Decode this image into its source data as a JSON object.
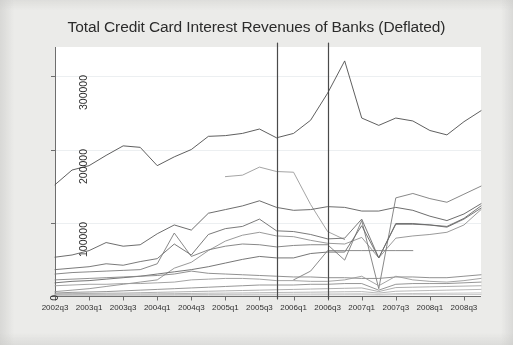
{
  "figure": {
    "background_color": "#ebebe9",
    "plot_background_color": "#ffffff",
    "frame_color": "#6e6e6e"
  },
  "chart_data": {
    "type": "line",
    "title": "Total Credit Card Interest Revenues of Banks (Deflated)",
    "xlabel": "",
    "ylabel": "",
    "grid": true,
    "legend_position": "none",
    "ylim": [
      0,
      340000
    ],
    "yticks": [
      0,
      100000,
      200000,
      300000
    ],
    "ytick_labels": [
      "0",
      "100000",
      "200000",
      "300000"
    ],
    "x": [
      "2002q3",
      "2002q4",
      "2003q1",
      "2003q2",
      "2003q3",
      "2003q4",
      "2004q1",
      "2004q2",
      "2004q3",
      "2004q4",
      "2005q1",
      "2005q2",
      "2005q3",
      "2005q4",
      "2006q1",
      "2006q2",
      "2006q3",
      "2006q4",
      "2007q1",
      "2007q2",
      "2007q3",
      "2007q4",
      "2008q1",
      "2008q2",
      "2008q3",
      "2008q4"
    ],
    "xtick_labels": [
      "2002q3",
      "2003q1",
      "2003q3",
      "2004q1",
      "2004q3",
      "2005q1",
      "2005q3",
      "2006q1",
      "2006q3",
      "2007q1",
      "2007q3",
      "2008q1",
      "2008q3"
    ],
    "xtick_indices": [
      0,
      2,
      4,
      6,
      8,
      10,
      12,
      14,
      16,
      18,
      20,
      22,
      24
    ],
    "reference_lines": [
      {
        "name": "vline-2005q4",
        "x_index": 13,
        "color": "#4a4a4a"
      },
      {
        "name": "vline-2006q3",
        "x_index": 16,
        "color": "#4a4a4a"
      }
    ],
    "series": [
      {
        "name": "bank-01",
        "color": "#4d4d4d",
        "values": [
          152000,
          172000,
          178000,
          192000,
          205000,
          203000,
          178000,
          190000,
          200000,
          218000,
          219000,
          222000,
          228000,
          216000,
          222000,
          240000,
          277000,
          321000,
          243000,
          233000,
          243000,
          239000,
          226000,
          220000,
          238000,
          253000
        ]
      },
      {
        "name": "bank-02",
        "color": "#9a9a9a",
        "values": [
          null,
          null,
          null,
          null,
          null,
          null,
          null,
          null,
          null,
          null,
          163000,
          165000,
          176000,
          170000,
          169000,
          125000,
          88000,
          77000,
          null,
          null,
          null,
          null,
          null,
          null,
          null,
          null
        ]
      },
      {
        "name": "bank-03",
        "color": "#5c5c5c",
        "values": [
          53000,
          56000,
          62000,
          73000,
          68000,
          70000,
          85000,
          97000,
          90000,
          113000,
          118000,
          123000,
          130000,
          121000,
          117000,
          118000,
          122000,
          121000,
          116000,
          116000,
          121000,
          117000,
          109000,
          103000,
          112000,
          126000
        ]
      },
      {
        "name": "bank-04",
        "color": "#6b6b6b",
        "values": [
          36000,
          38000,
          40000,
          44000,
          42000,
          47000,
          51000,
          71000,
          56000,
          84000,
          92000,
          95000,
          105000,
          89000,
          88000,
          84000,
          78000,
          79000,
          105000,
          52000,
          99000,
          99000,
          97000,
          94000,
          105000,
          120000
        ]
      },
      {
        "name": "bank-05",
        "color": "#8e8e8e",
        "values": [
          6000,
          8000,
          10000,
          13000,
          16000,
          19000,
          22000,
          38000,
          46000,
          62000,
          75000,
          83000,
          87000,
          82000,
          81000,
          76000,
          72000,
          71000,
          80000,
          52000,
          79000,
          82000,
          84000,
          87000,
          97000,
          118000
        ]
      },
      {
        "name": "bank-06",
        "color": "#7a7a7a",
        "values": [
          30000,
          32000,
          33000,
          34000,
          35000,
          36000,
          44000,
          86000,
          54000,
          63000,
          68000,
          71000,
          70000,
          67000,
          69000,
          70000,
          70000,
          49000,
          103000,
          10000,
          134000,
          140000,
          133000,
          128000,
          139000,
          150000
        ]
      },
      {
        "name": "bank-07",
        "color": "#676767",
        "values": [
          18000,
          20000,
          21000,
          23000,
          25000,
          27000,
          30000,
          33000,
          36000,
          40000,
          45000,
          50000,
          54000,
          52000,
          52000,
          58000,
          60000,
          60000,
          96000,
          52000,
          98000,
          98000,
          97000,
          95000,
          106000,
          123000
        ]
      },
      {
        "name": "bank-08",
        "color": "#7e7e7e",
        "values": [
          null,
          null,
          null,
          null,
          null,
          null,
          null,
          null,
          null,
          null,
          null,
          null,
          null,
          null,
          22000,
          34000,
          62000,
          62000,
          62000,
          62000,
          62000,
          62000,
          null,
          null,
          null,
          null
        ]
      },
      {
        "name": "bank-09",
        "color": "#858585",
        "values": [
          22000,
          23000,
          24000,
          25000,
          26000,
          27000,
          28000,
          30000,
          34000,
          31000,
          30000,
          29000,
          28000,
          27000,
          26000,
          26000,
          25000,
          25000,
          24000,
          24000,
          26000,
          26000,
          25000,
          25000,
          27000,
          29000
        ]
      },
      {
        "name": "bank-10",
        "color": "#9a9a9a",
        "values": [
          14000,
          15000,
          16000,
          16000,
          17000,
          17000,
          18000,
          19000,
          22000,
          23000,
          24000,
          24000,
          23000,
          21000,
          21000,
          20000,
          20000,
          22000,
          27000,
          14000,
          27000,
          22000,
          20000,
          19000,
          21000,
          24000
        ]
      },
      {
        "name": "bank-11",
        "color": "#8a8a8a",
        "values": [
          4000,
          5000,
          5500,
          6000,
          7000,
          8000,
          9000,
          10000,
          11000,
          12000,
          13000,
          14000,
          15000,
          15000,
          15000,
          16000,
          16000,
          17000,
          17000,
          8000,
          16000,
          17000,
          17000,
          17000,
          18000,
          19000
        ]
      },
      {
        "name": "bank-12",
        "color": "#a5a5a5",
        "values": [
          3000,
          3200,
          3500,
          3800,
          4000,
          4500,
          5000,
          5500,
          6000,
          6500,
          7000,
          7500,
          8000,
          8500,
          9000,
          9500,
          10000,
          10500,
          11000,
          6000,
          11500,
          12000,
          12500,
          13000,
          13500,
          14000
        ]
      },
      {
        "name": "bank-13",
        "color": "#b0b0b0",
        "values": [
          2000,
          2100,
          2200,
          2400,
          2600,
          2800,
          3000,
          3200,
          3500,
          3800,
          4000,
          4200,
          4500,
          4800,
          5000,
          5200,
          5500,
          5800,
          6000,
          4000,
          6500,
          7000,
          7500,
          8000,
          8500,
          9000
        ]
      },
      {
        "name": "bank-14",
        "color": "#bdbdbd",
        "values": [
          1200,
          1300,
          1400,
          1500,
          1600,
          1700,
          1800,
          1900,
          2000,
          2100,
          2200,
          2300,
          2400,
          2500,
          2600,
          2700,
          2800,
          2900,
          3000,
          2200,
          3200,
          3400,
          3600,
          3800,
          4000,
          4200
        ]
      },
      {
        "name": "bank-15",
        "color": "#c4c4c4",
        "values": [
          700,
          750,
          800,
          850,
          900,
          950,
          1000,
          1050,
          1100,
          1150,
          1200,
          1250,
          1300,
          1350,
          1400,
          1450,
          1500,
          1550,
          1600,
          1300,
          1700,
          1750,
          1800,
          1850,
          1900,
          2000
        ]
      }
    ]
  }
}
